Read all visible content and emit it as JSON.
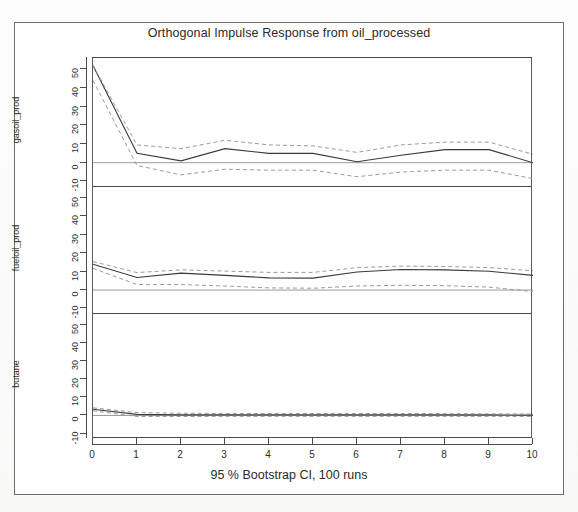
{
  "figure": {
    "title": "Orthogonal Impulse Response from oil_processed",
    "caption": "95 % Bootstrap CI,  100 runs"
  },
  "chart_data": {
    "type": "line",
    "title": "Orthogonal Impulse Response from oil_processed",
    "subtitle": "95 % Bootstrap CI,  100 runs",
    "xlabel": "",
    "ylabel": "",
    "grid": false,
    "legend": false,
    "x": [
      0,
      1,
      2,
      3,
      4,
      5,
      6,
      7,
      8,
      9,
      10
    ],
    "xlim": [
      0,
      10
    ],
    "xticks": [
      "0",
      "1",
      "2",
      "3",
      "4",
      "5",
      "6",
      "7",
      "8",
      "9",
      "10"
    ],
    "ylim": [
      -13,
      56
    ],
    "yticks": [
      "-10",
      "0",
      "10",
      "20",
      "30",
      "40",
      "50"
    ],
    "ytick_values": [
      -10,
      0,
      10,
      20,
      30,
      40,
      50
    ],
    "panels": [
      {
        "name": "gasoil_prod",
        "series": [
          {
            "name": "impulse response",
            "style": "solid",
            "values": [
              52.0,
              5.0,
              1.0,
              7.5,
              5.0,
              5.0,
              0.5,
              4.0,
              7.0,
              7.0,
              0.0
            ]
          },
          {
            "name": "upper 95% CI",
            "style": "dashed",
            "values": [
              52.0,
              9.5,
              7.5,
              12.0,
              9.5,
              9.0,
              5.5,
              9.5,
              11.0,
              11.0,
              4.5
            ]
          },
          {
            "name": "lower 95% CI",
            "style": "dashed",
            "values": [
              44.0,
              -1.5,
              -6.5,
              -3.5,
              -4.0,
              -4.0,
              -7.5,
              -5.0,
              -4.0,
              -4.0,
              -8.5
            ]
          }
        ]
      },
      {
        "name": "fueloil_prod",
        "series": [
          {
            "name": "impulse response",
            "style": "solid",
            "values": [
              14.0,
              6.8,
              9.2,
              8.0,
              6.6,
              6.5,
              9.8,
              11.2,
              11.0,
              10.2,
              8.0
            ]
          },
          {
            "name": "upper 95% CI",
            "style": "dashed",
            "values": [
              15.5,
              9.5,
              11.0,
              10.3,
              9.6,
              9.6,
              12.2,
              13.0,
              12.8,
              12.2,
              10.5
            ]
          },
          {
            "name": "lower 95% CI",
            "style": "dashed",
            "values": [
              11.8,
              3.0,
              3.0,
              2.2,
              1.2,
              1.0,
              2.2,
              2.6,
              2.4,
              1.6,
              -0.8
            ]
          }
        ]
      },
      {
        "name": "butane",
        "series": [
          {
            "name": "impulse response",
            "style": "solid",
            "values": [
              3.4,
              0.6,
              0.3,
              0.3,
              0.3,
              0.3,
              0.3,
              0.3,
              0.3,
              0.3,
              0.2
            ]
          },
          {
            "name": "upper 95% CI",
            "style": "dashed",
            "values": [
              4.2,
              1.6,
              1.2,
              1.1,
              1.1,
              1.1,
              1.1,
              1.1,
              1.0,
              0.9,
              0.8
            ]
          },
          {
            "name": "lower 95% CI",
            "style": "dashed",
            "values": [
              2.6,
              -0.6,
              -0.6,
              -0.5,
              -0.5,
              -0.5,
              -0.5,
              -0.5,
              -0.5,
              -0.5,
              -0.6
            ]
          }
        ]
      }
    ]
  }
}
